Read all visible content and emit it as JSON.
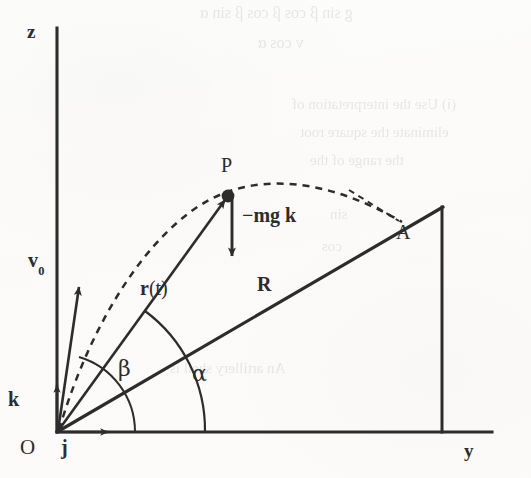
{
  "figure": {
    "caption_absent": true,
    "background_color": "#fcfcfa",
    "ink_color": "#2c2c2c"
  },
  "axes": {
    "vertical": {
      "label": "z",
      "x_px": 57,
      "top_px": 28,
      "bottom_px": 432
    },
    "horizontal": {
      "label": "y",
      "y_px": 432,
      "left_px": 57,
      "right_px": 492
    },
    "origin": {
      "label": "O",
      "x_px": 57,
      "y_px": 432
    }
  },
  "unit_vectors": [
    {
      "name": "k-unit-vector",
      "label": "k",
      "direction": "up",
      "tail": [
        57,
        432
      ],
      "head": [
        57,
        383
      ]
    },
    {
      "name": "j-unit-vector",
      "label": "j",
      "direction": "right",
      "tail": [
        57,
        432
      ],
      "head": [
        112,
        432
      ]
    }
  ],
  "vectors": [
    {
      "name": "initial-velocity",
      "label": "v",
      "subscript": "0",
      "tail": [
        57,
        432
      ],
      "head": [
        78,
        283
      ],
      "description": "initial velocity of the projectile at launch"
    },
    {
      "name": "position-vector",
      "label": "r(t)",
      "label_bold_part": "r",
      "label_plain_part": "(t)",
      "tail": [
        57,
        432
      ],
      "head": [
        228,
        196
      ],
      "description": "position vector from origin to the particle at time t"
    },
    {
      "name": "gravity-force",
      "label": "−mg k",
      "tail": [
        232,
        196
      ],
      "head": [
        232,
        260
      ],
      "description": "constant downward gravitational force on the particle"
    }
  ],
  "points": [
    {
      "name": "point-p",
      "label": "P",
      "x_px": 228,
      "y_px": 196,
      "marker": "filled-dot",
      "description": "particle position on the trajectory"
    },
    {
      "name": "point-a",
      "label": "A",
      "x_px": 400,
      "y_px": 223,
      "marker": "none",
      "description": "landing point of the projectile on the incline"
    },
    {
      "name": "point-o",
      "label": "O",
      "x_px": 57,
      "y_px": 432,
      "marker": "none",
      "description": "launch point at the origin"
    }
  ],
  "segments": [
    {
      "name": "incline-line",
      "label": "R",
      "from": [
        57,
        432
      ],
      "to": [
        442,
        208
      ],
      "style": "solid",
      "description": "the inclined plane; R is the range measured along the incline"
    },
    {
      "name": "incline-vertical-edge",
      "label": "",
      "from": [
        442,
        208
      ],
      "to": [
        442,
        432
      ],
      "style": "solid",
      "description": "vertical edge closing the inclined wedge"
    }
  ],
  "trajectory": {
    "name": "parabolic-trajectory",
    "style": "dashed",
    "from": [
      57,
      432
    ],
    "apex": [
      246,
      190
    ],
    "to": [
      400,
      223
    ],
    "description": "dashed parabolic path of the projectile from O through P to A"
  },
  "angles": [
    {
      "name": "angle-beta",
      "label": "β",
      "label_x_px": 118,
      "label_y_px": 373,
      "arc_radius_px": 78,
      "between": "horizontal axis and initial velocity v0",
      "description": "launch angle measured from the horizontal"
    },
    {
      "name": "angle-alpha",
      "label": "α",
      "label_x_px": 192,
      "label_y_px": 378,
      "arc_radius_px": 148,
      "between": "horizontal axis and the incline",
      "description": "inclination angle of the plane measured from the horizontal"
    },
    {
      "name": "angle-at-a",
      "label": "",
      "arc_radius_px": 0,
      "between": "incline and trajectory at landing point A",
      "description": "dashed guide showing the trajectory meeting the incline at A"
    }
  ],
  "bleed_through_text": [
    {
      "text": "g sin β cos β   cos β sin α",
      "x_px": 200,
      "y_px": 4,
      "size_px": 16
    },
    {
      "text": "v cos α",
      "x_px": 258,
      "y_px": 34,
      "size_px": 16
    },
    {
      "text": "(i)  Use the interpretation of",
      "x_px": 292,
      "y_px": 96,
      "size_px": 15
    },
    {
      "text": "eliminate the square root",
      "x_px": 300,
      "y_px": 124,
      "size_px": 15
    },
    {
      "text": "the range of the",
      "x_px": 310,
      "y_px": 152,
      "size_px": 15
    },
    {
      "text": "sin",
      "x_px": 330,
      "y_px": 206,
      "size_px": 15
    },
    {
      "text": "cos",
      "x_px": 322,
      "y_px": 238,
      "size_px": 15
    },
    {
      "text": "An artillery shell is",
      "x_px": 170,
      "y_px": 360,
      "size_px": 15
    }
  ]
}
